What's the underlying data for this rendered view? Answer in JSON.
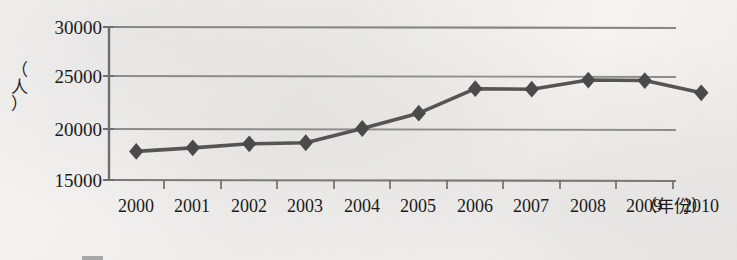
{
  "chart_data": {
    "type": "line",
    "title": "",
    "xlabel": "（年份）",
    "ylabel": "（人）",
    "categories": [
      "2000",
      "2001",
      "2002",
      "2003",
      "2004",
      "2005",
      "2006",
      "2007",
      "2008",
      "2009",
      "2010"
    ],
    "values": [
      17800,
      18150,
      18550,
      18650,
      20050,
      21550,
      23950,
      23900,
      24800,
      24750,
      23550
    ],
    "series": [
      {
        "name": "人数",
        "values": [
          17800,
          18150,
          18550,
          18650,
          20050,
          21550,
          23950,
          23900,
          24800,
          24750,
          23550
        ]
      }
    ],
    "ylim": [
      15000,
      30000
    ],
    "ytick_labels": [
      "30000",
      "25000",
      "20000",
      "15000"
    ],
    "ytick_values": [
      30000,
      25000,
      20000,
      15000
    ],
    "grid": true,
    "legend_position": "bottom",
    "marker": "diamond",
    "line_color": "#555555",
    "marker_color": "#4a4a4a",
    "grid_color": "#8a8a8a",
    "axis_color": "#6f6f6f"
  },
  "axis": {
    "y_title_chars": [
      "（",
      "人",
      "）"
    ],
    "x_unit": "（年份）"
  }
}
